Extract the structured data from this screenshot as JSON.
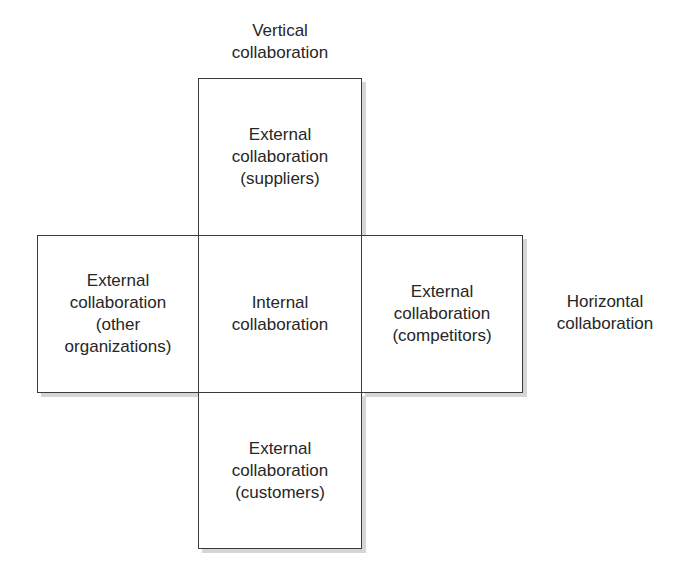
{
  "diagram": {
    "type": "cross-shaped collaboration matrix",
    "axes": {
      "vertical": "Vertical\ncollaboration",
      "horizontal": "Horizontal\ncollaboration"
    },
    "boxes": {
      "top": "External\ncollaboration\n(suppliers)",
      "left": "External\ncollaboration\n(other\norganizations)",
      "center": "Internal\ncollaboration",
      "right": "External\ncollaboration\n(competitors)",
      "bottom": "External\ncollaboration\n(customers)"
    },
    "colors": {
      "border": "#3a3a3a",
      "text": "#262626",
      "shadow": "#d6d6d6",
      "background": "#ffffff"
    }
  }
}
